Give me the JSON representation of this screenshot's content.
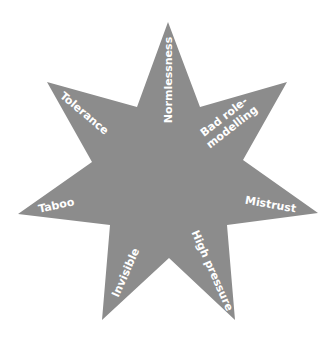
{
  "diagram": {
    "type": "seven-pointed-star",
    "fill_color": "#8c8c8c",
    "text_color": "#ffffff",
    "background": "#ffffff",
    "labels": {
      "normlessness": "Normlessness",
      "bad_role_line1": "Bad role-",
      "bad_role_line2": "modelling",
      "mistrust": "Mistrust",
      "high_pressure": "High pressure",
      "invisible": "Invisible",
      "taboo": "Taboo",
      "tolerance": "Tolerance"
    },
    "points": [
      "Normlessness",
      "Bad role-modelling",
      "Mistrust",
      "High pressure",
      "Invisible",
      "Taboo",
      "Tolerance"
    ]
  }
}
